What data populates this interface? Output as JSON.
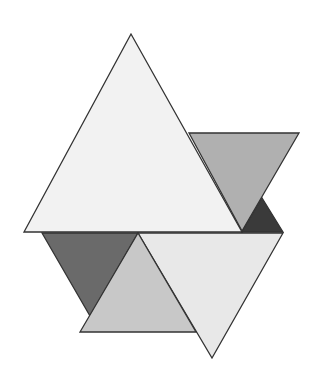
{
  "diagram": {
    "type": "overlapping-triangles",
    "shapes": [
      {
        "id": "large-upper-triangle",
        "orientation": "up",
        "shade": "very-light-gray",
        "color": "#f2f2f2"
      },
      {
        "id": "right-gray-triangle",
        "orientation": "down",
        "shade": "medium-gray",
        "color": "#b0b0b0"
      },
      {
        "id": "small-black-triangle",
        "orientation": "up",
        "shade": "near-black",
        "color": "#3a3a3a"
      },
      {
        "id": "left-dark-triangle",
        "orientation": "down",
        "shade": "dark-gray",
        "color": "#6a6a6a"
      },
      {
        "id": "lower-right-light-triangle",
        "orientation": "down",
        "shade": "light-gray",
        "color": "#e8e8e8"
      },
      {
        "id": "lower-middle-gray-triangle",
        "orientation": "up",
        "shade": "light-medium-gray",
        "color": "#c8c8c8"
      }
    ],
    "outline_color": "#333333",
    "background_color": "#ffffff"
  }
}
